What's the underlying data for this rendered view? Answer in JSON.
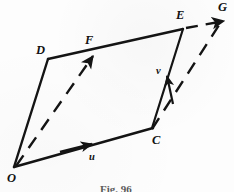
{
  "figure": {
    "caption": "Fig. 96",
    "stroke_color": "#141414",
    "background_color": "#fdfdfd",
    "vertices": [
      {
        "name": "O",
        "label": "O",
        "x": 14,
        "y": 167,
        "label_x": 7,
        "label_y": 172
      },
      {
        "name": "D",
        "label": "D",
        "x": 48,
        "y": 59,
        "label_x": 36,
        "label_y": 44
      },
      {
        "name": "F",
        "label": "F",
        "x": 91,
        "y": 53,
        "label_x": 85,
        "label_y": 34
      },
      {
        "name": "E",
        "label": "E",
        "x": 182,
        "y": 29,
        "label_x": 176,
        "label_y": 9
      },
      {
        "name": "C",
        "label": "C",
        "x": 152,
        "y": 128,
        "label_x": 152,
        "label_y": 134
      },
      {
        "name": "G",
        "label": "G",
        "x": 222,
        "y": 20,
        "label_x": 218,
        "label_y": 1
      }
    ],
    "vectors": [
      {
        "name": "u",
        "label": "u",
        "from": "O",
        "to": "C",
        "label_x": 89,
        "label_y": 152
      },
      {
        "name": "v",
        "label": "v",
        "from": "C",
        "to": "E",
        "label_x": 156,
        "label_y": 66
      }
    ],
    "solid_edges": [
      {
        "name": "edge-O-D",
        "from": "O",
        "to": "D"
      },
      {
        "name": "edge-D-E",
        "from": "D",
        "to": "E"
      },
      {
        "name": "edge-O-C",
        "from": "O",
        "to": "C"
      },
      {
        "name": "edge-C-E",
        "from": "C",
        "to": "E"
      }
    ],
    "dashed_edges": [
      {
        "name": "dashed-O-F",
        "from": "O",
        "to": "F"
      },
      {
        "name": "dashed-C-G",
        "from": "C",
        "to": "G"
      },
      {
        "name": "dashed-E-G",
        "from": "E",
        "to": "G"
      }
    ]
  }
}
